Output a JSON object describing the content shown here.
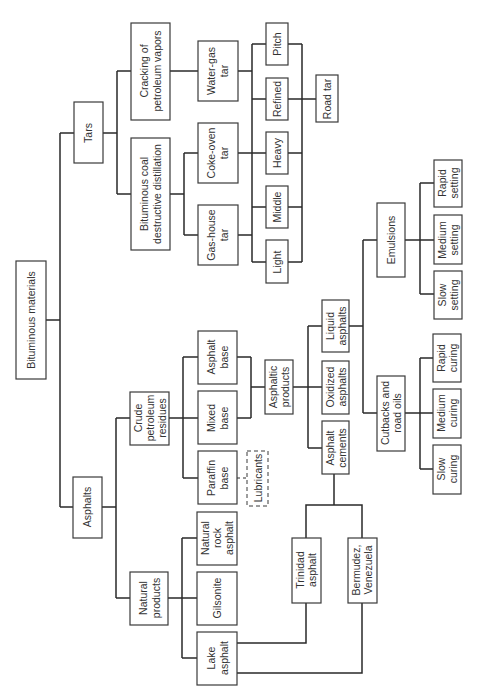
{
  "diagram": {
    "orientation": "rotated-90-ccw",
    "nodes": {
      "root": {
        "label": [
          "Bituminous materials"
        ]
      },
      "tars": {
        "label": [
          "Tars"
        ]
      },
      "asphalts": {
        "label": [
          "Asphalts"
        ]
      },
      "cracking": {
        "label": [
          "Cracking of",
          "petroleum vapors"
        ]
      },
      "coal_distillation": {
        "label": [
          "Bituminous coal",
          "destructive distillation"
        ]
      },
      "water_gas_tar": {
        "label": [
          "Water-gas",
          "tar"
        ]
      },
      "coke_oven_tar": {
        "label": [
          "Coke-oven",
          "tar"
        ]
      },
      "gas_house_tar": {
        "label": [
          "Gas-house",
          "tar"
        ]
      },
      "pitch": {
        "label": [
          "Pitch"
        ]
      },
      "refined": {
        "label": [
          "Refined"
        ]
      },
      "heavy": {
        "label": [
          "Heavy"
        ]
      },
      "middle": {
        "label": [
          "Middle"
        ]
      },
      "light": {
        "label": [
          "Light"
        ]
      },
      "road_tar": {
        "label": [
          "Road tar"
        ]
      },
      "crude_residues": {
        "label": [
          "Crude",
          "petroleum",
          "residues"
        ]
      },
      "asphalt_base": {
        "label": [
          "Asphalt",
          "base"
        ]
      },
      "mixed_base": {
        "label": [
          "Mixed",
          "base"
        ]
      },
      "paraffin_base": {
        "label": [
          "Paraffin",
          "base"
        ]
      },
      "lubricants": {
        "label": [
          "Lubricants"
        ],
        "style": "dashed"
      },
      "asphaltic_products": {
        "label": [
          "Asphaltic",
          "products"
        ]
      },
      "liquid_asphalts": {
        "label": [
          "Liquid",
          "asphalts"
        ]
      },
      "oxidized_asphalts": {
        "label": [
          "Oxidized",
          "asphalts"
        ]
      },
      "asphalt_cements": {
        "label": [
          "Asphalt",
          "cements"
        ]
      },
      "emulsions": {
        "label": [
          "Emulsions"
        ]
      },
      "cutbacks": {
        "label": [
          "Cutbacks and",
          "road oils"
        ]
      },
      "rapid_setting": {
        "label": [
          "Rapid",
          "setting"
        ]
      },
      "medium_setting": {
        "label": [
          "Medium",
          "setting"
        ]
      },
      "slow_setting": {
        "label": [
          "Slow",
          "setting"
        ]
      },
      "rapid_curing": {
        "label": [
          "Rapid",
          "curing"
        ]
      },
      "medium_curing": {
        "label": [
          "Medium",
          "curing"
        ]
      },
      "slow_curing": {
        "label": [
          "Slow",
          "curing"
        ]
      },
      "natural_products": {
        "label": [
          "Natural",
          "products"
        ]
      },
      "natural_rock_asphalt": {
        "label": [
          "Natural",
          "rock",
          "asphalt"
        ]
      },
      "gilsonite": {
        "label": [
          "Gilsonite"
        ]
      },
      "lake_asphalt": {
        "label": [
          "Lake",
          "asphalt"
        ]
      },
      "trinidad_asphalt": {
        "label": [
          "Trinidad",
          "asphalt"
        ]
      },
      "bermudez": {
        "label": [
          "Bermudez,",
          "Venezuela"
        ]
      }
    },
    "edges": [
      [
        "root",
        "tars"
      ],
      [
        "root",
        "asphalts"
      ],
      [
        "tars",
        "cracking"
      ],
      [
        "tars",
        "coal_distillation"
      ],
      [
        "cracking",
        "water_gas_tar"
      ],
      [
        "coal_distillation",
        "coke_oven_tar"
      ],
      [
        "coal_distillation",
        "gas_house_tar"
      ],
      [
        "water_gas_tar",
        "pitch"
      ],
      [
        "water_gas_tar",
        "refined"
      ],
      [
        "water_gas_tar",
        "heavy"
      ],
      [
        "water_gas_tar",
        "middle"
      ],
      [
        "water_gas_tar",
        "light"
      ],
      [
        "coke_oven_tar",
        "pitch"
      ],
      [
        "coke_oven_tar",
        "refined"
      ],
      [
        "coke_oven_tar",
        "heavy"
      ],
      [
        "coke_oven_tar",
        "middle"
      ],
      [
        "coke_oven_tar",
        "light"
      ],
      [
        "gas_house_tar",
        "pitch"
      ],
      [
        "gas_house_tar",
        "refined"
      ],
      [
        "gas_house_tar",
        "heavy"
      ],
      [
        "gas_house_tar",
        "middle"
      ],
      [
        "gas_house_tar",
        "light"
      ],
      [
        "pitch",
        "road_tar"
      ],
      [
        "refined",
        "road_tar"
      ],
      [
        "heavy",
        "road_tar"
      ],
      [
        "middle",
        "road_tar"
      ],
      [
        "light",
        "road_tar"
      ],
      [
        "asphalts",
        "crude_residues"
      ],
      [
        "asphalts",
        "natural_products"
      ],
      [
        "crude_residues",
        "asphalt_base"
      ],
      [
        "crude_residues",
        "mixed_base"
      ],
      [
        "crude_residues",
        "paraffin_base"
      ],
      [
        "asphalt_base",
        "asphaltic_products"
      ],
      [
        "mixed_base",
        "asphaltic_products"
      ],
      [
        "paraffin_base",
        "lubricants"
      ],
      [
        "asphaltic_products",
        "liquid_asphalts"
      ],
      [
        "asphaltic_products",
        "oxidized_asphalts"
      ],
      [
        "asphaltic_products",
        "asphalt_cements"
      ],
      [
        "liquid_asphalts",
        "emulsions"
      ],
      [
        "liquid_asphalts",
        "cutbacks"
      ],
      [
        "emulsions",
        "rapid_setting"
      ],
      [
        "emulsions",
        "medium_setting"
      ],
      [
        "emulsions",
        "slow_setting"
      ],
      [
        "cutbacks",
        "rapid_curing"
      ],
      [
        "cutbacks",
        "medium_curing"
      ],
      [
        "cutbacks",
        "slow_curing"
      ],
      [
        "natural_products",
        "natural_rock_asphalt"
      ],
      [
        "natural_products",
        "gilsonite"
      ],
      [
        "natural_products",
        "lake_asphalt"
      ],
      [
        "lake_asphalt",
        "trinidad_asphalt"
      ],
      [
        "lake_asphalt",
        "bermudez"
      ],
      [
        "trinidad_asphalt",
        "asphalt_cements"
      ],
      [
        "bermudez",
        "asphalt_cements"
      ]
    ]
  }
}
